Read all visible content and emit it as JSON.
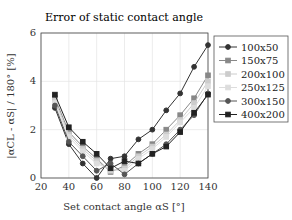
{
  "chart_data": {
    "type": "line",
    "title": "Error of static contact angle",
    "xlabel": "Set contact angle αS [°]",
    "ylabel": "|αCL - αS| / 180° [%]",
    "xlim": [
      20,
      140
    ],
    "ylim": [
      0,
      6
    ],
    "xticks": [
      20,
      40,
      60,
      80,
      100,
      120,
      140
    ],
    "yticks": [
      0,
      2,
      4,
      6
    ],
    "grid": true,
    "legend_position": "right-outside-top",
    "x": [
      30,
      40,
      50,
      60,
      70,
      80,
      90,
      100,
      110,
      120,
      130,
      140
    ],
    "series": [
      {
        "name": "100x50",
        "color": "#333333",
        "marker": "circle",
        "values": [
          2.9,
          1.4,
          0.6,
          0.0,
          0.8,
          0.9,
          1.6,
          2.0,
          2.8,
          3.5,
          4.6,
          5.5
        ]
      },
      {
        "name": "150x75",
        "color": "#888888",
        "marker": "square",
        "values": [
          3.3,
          1.9,
          1.3,
          0.8,
          0.25,
          0.5,
          1.0,
          1.4,
          2.0,
          2.6,
          3.3,
          4.25
        ]
      },
      {
        "name": "200x100",
        "color": "#cccccc",
        "marker": "square",
        "values": [
          3.2,
          1.8,
          1.2,
          0.7,
          0.3,
          0.4,
          0.9,
          1.3,
          1.8,
          2.4,
          3.1,
          4.0
        ]
      },
      {
        "name": "250x125",
        "color": "#dddddd",
        "marker": "square",
        "values": [
          3.1,
          1.7,
          1.1,
          0.6,
          0.35,
          0.3,
          0.8,
          1.2,
          1.7,
          2.3,
          2.9,
          3.8
        ]
      },
      {
        "name": "300x150",
        "color": "#555555",
        "marker": "circle",
        "values": [
          3.0,
          1.5,
          0.9,
          0.3,
          0.6,
          0.15,
          0.6,
          1.0,
          1.4,
          2.0,
          2.6,
          3.5
        ]
      },
      {
        "name": "400x200",
        "color": "#222222",
        "marker": "square",
        "values": [
          3.45,
          2.1,
          1.5,
          1.0,
          0.4,
          0.7,
          0.6,
          1.0,
          1.3,
          1.9,
          2.7,
          3.45
        ]
      }
    ]
  }
}
